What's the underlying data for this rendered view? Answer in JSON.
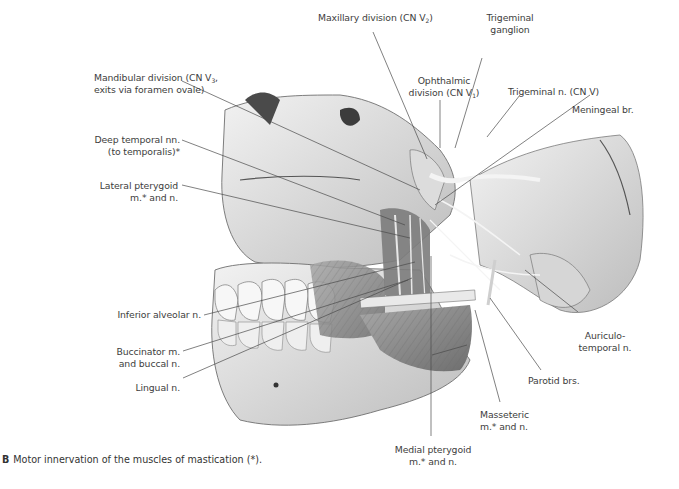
{
  "figure": {
    "caption_letter": "B",
    "caption_text": "Motor innervation of the muscles of mastication (*)."
  },
  "labels": {
    "mandibular_division": {
      "line1": "Mandibular division (CN V",
      "sub": "3",
      "line1_end": ",",
      "line2": "exits via foramen ovale)"
    },
    "deep_temporal": {
      "line1": "Deep temporal nn.",
      "line2": "(to temporalis)*"
    },
    "lateral_pterygoid": {
      "line1": "Lateral pterygoid",
      "line2": "m.* and n."
    },
    "inferior_alveolar": {
      "line1": "Inferior alveolar n."
    },
    "buccinator": {
      "line1": "Buccinator m.",
      "line2": "and buccal n."
    },
    "lingual": {
      "line1": "Lingual n."
    },
    "maxillary_division": {
      "line1": "Maxillary division (CN V",
      "sub": "2",
      "line1_end": ")"
    },
    "ophthalmic_division": {
      "line1": "Ophthalmic",
      "line2": "division (CN V",
      "sub": "1",
      "line2_end": ")"
    },
    "trigeminal_ganglion": {
      "line1": "Trigeminal",
      "line2": "ganglion"
    },
    "trigeminal_nerve": {
      "line1": "Trigeminal n. (CN V)"
    },
    "meningeal_branch": {
      "line1": "Meningeal br."
    },
    "auriculotemporal": {
      "line1": "Auriculo-",
      "line2": "temporal n."
    },
    "parotid_branches": {
      "line1": "Parotid brs."
    },
    "masseteric": {
      "line1": "Masseteric",
      "line2": "m.* and n."
    },
    "medial_pterygoid": {
      "line1": "Medial pterygoid",
      "line2": "m.* and n."
    }
  },
  "colors": {
    "background": "#ffffff",
    "label_text": "#3d3d3d",
    "leader_line": "#4a4a4a",
    "bone_light": "#ececec",
    "bone_mid": "#c9c9c9",
    "muscle": "#8f8f8f",
    "shadow": "#5a5a5a"
  }
}
